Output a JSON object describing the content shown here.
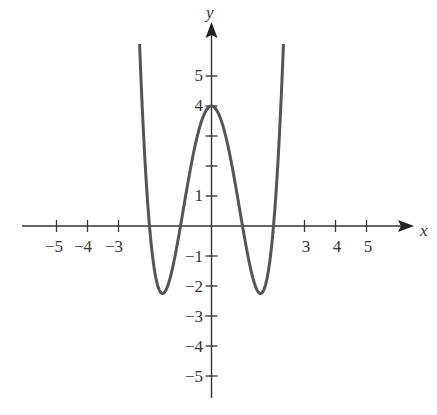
{
  "chart_data": {
    "type": "line",
    "title": "",
    "function": "y = (x^2 - 1)(x^2 - 4) = x^4 - 5x^2 + 4",
    "xlabel": "x",
    "ylabel": "y",
    "xlim": [
      -6,
      6.5
    ],
    "ylim": [
      -6,
      6.5
    ],
    "x_tick_labels": [
      "-5",
      "-4",
      "-3",
      "3",
      "4",
      "5"
    ],
    "x_ticks": [
      -5,
      -4,
      -3,
      3,
      4,
      5
    ],
    "y_tick_labels": [
      "5",
      "4",
      "1",
      "-1",
      "-2",
      "-3",
      "-4",
      "-5"
    ],
    "y_ticks": [
      5,
      4,
      3,
      2,
      1,
      -1,
      -2,
      -3,
      -4,
      -5
    ],
    "grid": false,
    "legend": null,
    "key_points": {
      "y_intercept": [
        0,
        4
      ],
      "roots": [
        -2,
        -1,
        1,
        2
      ],
      "minima": [
        [
          -1.58,
          -2.25
        ],
        [
          1.58,
          -2.25
        ]
      ],
      "local_max": [
        0,
        4
      ]
    },
    "curve_color": "#555555",
    "axis_color": "#333333"
  },
  "labels": {
    "x_axis": "x",
    "y_axis": "y",
    "x_ticks": [
      "−5",
      "−4",
      "−3",
      "3",
      "4",
      "5"
    ],
    "y_ticks_pos": [
      "5",
      "4",
      "1"
    ],
    "y_ticks_neg": [
      "−1",
      "−2",
      "−3",
      "−4",
      "−5"
    ]
  }
}
